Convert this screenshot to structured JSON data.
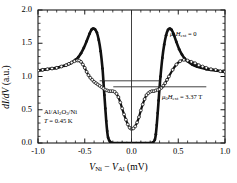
{
  "figure": {
    "type": "scatter-line",
    "xlabel_html": "V_Ni - V_Al (mV)",
    "ylabel_html": "dI/dV (a.u.)"
  },
  "axes": {
    "x": {
      "min": -1.0,
      "max": 1.0,
      "ticks": [
        -1.0,
        -0.5,
        0.0,
        0.5,
        1.0
      ],
      "tick_labels": [
        "-1.0",
        "-0.5",
        "0.0",
        "0.5",
        "1.0"
      ],
      "minor_per_interval": 5,
      "label_main": "V",
      "label_sub1": "Ni",
      "label_minus": " − ",
      "label_main2": "V",
      "label_sub2": "Al",
      "label_unit": " (mV)"
    },
    "y": {
      "min": 0.0,
      "max": 2.0,
      "ticks": [
        0.0,
        0.5,
        1.0,
        1.5,
        2.0
      ],
      "tick_labels": [
        "0.0",
        "0.5",
        "1.0",
        "1.5",
        "2.0"
      ],
      "minor_per_interval": 5,
      "label_d1": "d",
      "label_I": "I",
      "label_d2": "/d",
      "label_V": "V",
      "label_unit": " (a.u.)"
    }
  },
  "annotations": {
    "curve_zero_field": {
      "mu": "μ",
      "sub0": "0",
      "H": "H",
      "subext": "ext",
      "value": " = 0",
      "x": 170,
      "y": 30
    },
    "curve_field": {
      "mu": "μ",
      "sub0": "0",
      "H": "H",
      "subext": "ext",
      "value": " = 3.37 T",
      "x": 162,
      "y": 93
    },
    "sample": {
      "line1_a": "Al/Al",
      "line1_sub1": "2",
      "line1_b": "O",
      "line1_sub2": "3",
      "line1_c": "/Ni",
      "line2_T": "T",
      "line2_val": " = 0.45 K",
      "x": 44,
      "y": 108
    }
  },
  "markers": {
    "vertical_line": {
      "x": 0.0,
      "y0": 0.0,
      "y1": 2.0
    },
    "horizontal_line_upper": {
      "y": 0.935,
      "x0": -0.34,
      "x1": 0.3
    },
    "horizontal_line_lower": {
      "y": 0.845,
      "x0": -0.195,
      "x1": 0.8
    }
  },
  "chart_data": {
    "type": "line",
    "title": "",
    "xlabel": "V_Ni - V_Al (mV)",
    "ylabel": "dI/dV (a.u.)",
    "xlim": [
      -1.0,
      1.0
    ],
    "ylim": [
      0.0,
      2.0
    ],
    "grid": false,
    "legend_position": "inline-annotation",
    "series": [
      {
        "name": "mu0*H_ext = 0",
        "marker": "filled-circle",
        "x": [
          -1.0,
          -0.95,
          -0.9,
          -0.85,
          -0.8,
          -0.75,
          -0.7,
          -0.65,
          -0.6,
          -0.57,
          -0.54,
          -0.51,
          -0.48,
          -0.45,
          -0.43,
          -0.41,
          -0.39,
          -0.37,
          -0.35,
          -0.33,
          -0.31,
          -0.3,
          -0.29,
          -0.28,
          -0.27,
          -0.26,
          -0.25,
          -0.23,
          -0.2,
          -0.15,
          -0.1,
          -0.05,
          0.0,
          0.05,
          0.1,
          0.15,
          0.2,
          0.23,
          0.25,
          0.26,
          0.27,
          0.28,
          0.29,
          0.3,
          0.31,
          0.33,
          0.35,
          0.37,
          0.39,
          0.41,
          0.43,
          0.45,
          0.48,
          0.51,
          0.54,
          0.57,
          0.6,
          0.65,
          0.7,
          0.75,
          0.8,
          0.85,
          0.9,
          0.95,
          1.0
        ],
        "y": [
          1.09,
          1.1,
          1.11,
          1.12,
          1.13,
          1.15,
          1.17,
          1.2,
          1.25,
          1.29,
          1.35,
          1.43,
          1.53,
          1.64,
          1.7,
          1.72,
          1.71,
          1.66,
          1.55,
          1.38,
          1.12,
          0.92,
          0.72,
          0.52,
          0.33,
          0.18,
          0.08,
          0.02,
          0.0,
          0.0,
          0.0,
          0.0,
          0.0,
          0.0,
          0.0,
          0.0,
          0.0,
          0.01,
          0.05,
          0.13,
          0.27,
          0.45,
          0.64,
          0.83,
          1.0,
          1.28,
          1.48,
          1.62,
          1.7,
          1.72,
          1.7,
          1.64,
          1.52,
          1.41,
          1.33,
          1.27,
          1.23,
          1.18,
          1.15,
          1.13,
          1.11,
          1.1,
          1.09,
          1.08,
          1.07
        ]
      },
      {
        "name": "mu0*H_ext = 3.37 T",
        "marker": "open-circle",
        "x": [
          -1.0,
          -0.95,
          -0.9,
          -0.85,
          -0.8,
          -0.75,
          -0.7,
          -0.67,
          -0.64,
          -0.61,
          -0.58,
          -0.56,
          -0.54,
          -0.52,
          -0.5,
          -0.48,
          -0.46,
          -0.44,
          -0.42,
          -0.4,
          -0.38,
          -0.36,
          -0.34,
          -0.32,
          -0.3,
          -0.28,
          -0.26,
          -0.24,
          -0.22,
          -0.2,
          -0.18,
          -0.16,
          -0.14,
          -0.12,
          -0.1,
          -0.08,
          -0.06,
          -0.04,
          -0.02,
          0.0,
          0.02,
          0.04,
          0.06,
          0.08,
          0.1,
          0.12,
          0.14,
          0.16,
          0.18,
          0.2,
          0.22,
          0.24,
          0.26,
          0.28,
          0.3,
          0.32,
          0.34,
          0.36,
          0.38,
          0.4,
          0.44,
          0.48,
          0.52,
          0.56,
          0.6,
          0.64,
          0.68,
          0.72,
          0.76,
          0.8,
          0.85,
          0.9,
          0.95,
          1.0
        ],
        "y": [
          1.09,
          1.1,
          1.11,
          1.12,
          1.13,
          1.15,
          1.17,
          1.19,
          1.21,
          1.23,
          1.24,
          1.24,
          1.22,
          1.18,
          1.13,
          1.07,
          1.02,
          0.98,
          0.95,
          0.92,
          0.9,
          0.88,
          0.86,
          0.84,
          0.82,
          0.8,
          0.79,
          0.78,
          0.78,
          0.78,
          0.77,
          0.74,
          0.69,
          0.61,
          0.52,
          0.43,
          0.35,
          0.28,
          0.23,
          0.21,
          0.22,
          0.25,
          0.31,
          0.39,
          0.49,
          0.58,
          0.66,
          0.72,
          0.75,
          0.77,
          0.78,
          0.78,
          0.79,
          0.8,
          0.81,
          0.83,
          0.86,
          0.9,
          0.95,
          1.0,
          1.1,
          1.18,
          1.23,
          1.25,
          1.24,
          1.22,
          1.2,
          1.17,
          1.15,
          1.13,
          1.11,
          1.1,
          1.08,
          1.07
        ]
      }
    ]
  },
  "style": {
    "axis_color": "#1a1a1a",
    "curve_color": "#111111",
    "marker_edge": "#111111",
    "marker_face": "#ffffff",
    "background": "#ffffff"
  }
}
